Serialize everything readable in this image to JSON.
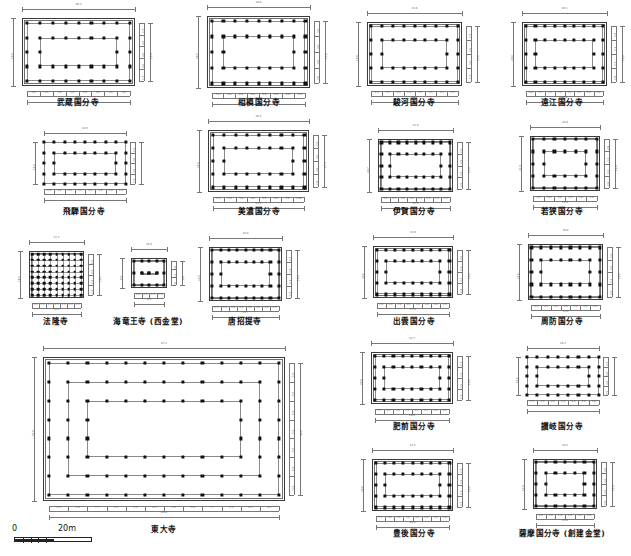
{
  "figure": {
    "type": "architectural-plan-comparison",
    "scale_bar": {
      "start_label": "0",
      "end_label": "20m",
      "length_m": 20,
      "segments": 5
    }
  },
  "plans": [
    {
      "id": "musashi-kokubunji",
      "caption": "武蔵国分寺",
      "has_outer_wall": true,
      "width_label": "40.3",
      "height_label": "19.4",
      "inner_width_label": "36.3",
      "inner_height_label": "15.4",
      "cols": 9,
      "rows": 5,
      "bay_labels_x": [
        "3.0",
        "5.0",
        "5.0",
        "5.0",
        "5.0",
        "5.0",
        "5.0",
        "3.6"
      ],
      "bay_labels_y": [
        "2.7",
        "4.0",
        "4.0",
        "4.0",
        "2.7"
      ]
    },
    {
      "id": "sagami-kokubunji",
      "caption": "相模国分寺",
      "has_outer_wall": true,
      "width_label": "38.0",
      "height_label": "20.5",
      "inner_width_label": "34.2",
      "inner_height_label": "17.0",
      "cols": 9,
      "rows": 5,
      "bay_labels_x": [
        "2.9",
        "4.8",
        "4.8",
        "4.8",
        "4.8",
        "4.8",
        "4.8",
        "2.9"
      ],
      "bay_labels_y": [
        "3.0",
        "4.0",
        "4.0",
        "3.0"
      ]
    },
    {
      "id": "suruga-kokubunji",
      "caption": "駿河国分寺",
      "has_outer_wall": true,
      "width_label": "32.6",
      "height_label": "19.0",
      "inner_width_label": "28.7",
      "inner_height_label": "17.0",
      "cols": 9,
      "rows": 5,
      "bay_labels_x": [
        "2.9",
        "3.5",
        "3.5",
        "3.5",
        "3.5",
        "3.5",
        "3.5",
        "2.9"
      ],
      "bay_labels_y": [
        "2.7",
        "3.6",
        "3.6",
        "2.7"
      ]
    },
    {
      "id": "totomi-kokubunji",
      "caption": "遠江国分寺",
      "has_outer_wall": true,
      "width_label": "30.1",
      "height_label": "20.0",
      "inner_width_label": "27.6",
      "inner_height_label": "16.0",
      "cols": 9,
      "rows": 5,
      "bay_labels_x": [
        "2.8",
        "3.2",
        "3.2",
        "3.2",
        "3.2",
        "3.2",
        "2.9",
        "2.8"
      ],
      "bay_labels_y": [
        "2.9",
        "3.3",
        "3.3",
        "2.9"
      ]
    },
    {
      "id": "hida-kokubunji",
      "caption": "飛騨国分寺",
      "has_outer_wall": false,
      "width_label": "28.5",
      "height_label": "14.0",
      "inner_width_label": "",
      "inner_height_label": "",
      "cols": 9,
      "rows": 5,
      "bay_labels_x": [
        "2.4",
        "3.0",
        "3.6",
        "3.6",
        "3.6",
        "3.6",
        "3.0",
        "2.4"
      ],
      "bay_labels_y": [
        "2.4",
        "3.0",
        "3.0",
        "2.4"
      ]
    },
    {
      "id": "mino-kokubunji",
      "caption": "美濃国分寺",
      "has_outer_wall": true,
      "width_label": "36.3",
      "height_label": "22.0",
      "inner_width_label": "29.5",
      "inner_height_label": "17.5",
      "cols": 9,
      "rows": 5,
      "bay_labels_x": [
        "2.9",
        "3.6",
        "3.6",
        "3.6",
        "3.6",
        "3.6",
        "3.0",
        "2.98"
      ],
      "bay_labels_y": [
        "2.9",
        "3.6",
        "3.6",
        "2.9"
      ]
    },
    {
      "id": "iga-kokubunji",
      "caption": "伊賀国分寺",
      "has_outer_wall": true,
      "width_label": "31.0",
      "height_label": "20.7",
      "inner_width_label": "26.6",
      "inner_height_label": "17.0",
      "cols": 9,
      "rows": 5,
      "bay_labels_x": [
        "2.6",
        "3.5",
        "3.0",
        "3.0",
        "3.0",
        "3.0",
        "3.0",
        "2.6"
      ],
      "bay_labels_y": [
        "2.6",
        "3.3",
        "3.3",
        "2.6"
      ]
    },
    {
      "id": "wakasa-kokubunji",
      "caption": "若狭国分寺",
      "has_outer_wall": true,
      "width_label": "28.0",
      "height_label": "21.0",
      "inner_width_label": "22.0",
      "inner_height_label": "16.0",
      "cols": 7,
      "rows": 5,
      "bay_labels_x": [
        "3.0",
        "3.0",
        "3.0",
        "3.0",
        "3.0",
        "3.0"
      ],
      "bay_labels_y": [
        "2.8",
        "3.3",
        "3.3",
        "2.8"
      ]
    },
    {
      "id": "horyuji",
      "caption": "法隆寺",
      "has_outer_wall": true,
      "width_label": "22.2",
      "height_label": "18.2",
      "inner_width_label": "20.2",
      "inner_height_label": "15.2",
      "cols": 9,
      "rows": 8,
      "dense_grid": true,
      "bay_labels_x": [
        "2.2",
        "2.3",
        "2.3",
        "2.3",
        "2.3",
        "2.3",
        "2.2"
      ],
      "bay_labels_y": [
        "2.2",
        "2.3",
        "2.3",
        "2.2"
      ]
    },
    {
      "id": "kairyuoji-saikondo",
      "caption": "海竜王寺 (西金堂)",
      "has_outer_wall": true,
      "width_label": "10.4",
      "height_label": "8.0",
      "inner_width_label": "8.4",
      "inner_height_label": "6.0",
      "cols": 5,
      "rows": 3,
      "bay_labels_x": [
        "2.0",
        "2.2",
        "2.2",
        "2.0"
      ],
      "bay_labels_y": [
        "2.0",
        "2.2",
        "2.0"
      ]
    },
    {
      "id": "toshodaiji",
      "caption": "唐招提寺",
      "has_outer_wall": true,
      "width_label": "28.0",
      "height_label": "20.0",
      "inner_width_label": "25.7",
      "inner_height_label": "16.0",
      "cols": 9,
      "rows": 5,
      "bay_labels_x": [
        "2.5",
        "3.0",
        "3.0",
        "3.0",
        "3.0",
        "3.0",
        "3.0",
        "2.5"
      ],
      "bay_labels_y": [
        "2.7",
        "3.3",
        "3.3",
        "2.7"
      ]
    },
    {
      "id": "izumo-kokubunji",
      "caption": "出雲国分寺",
      "has_outer_wall": true,
      "width_label": "32.0",
      "height_label": "20.0",
      "inner_width_label": "27.0",
      "inner_height_label": "16.0",
      "cols": 9,
      "rows": 5,
      "bay_labels_x": [
        "2.6",
        "3.0",
        "3.0",
        "3.0",
        "3.0",
        "3.0",
        "3.0",
        "2.6"
      ],
      "bay_labels_y": [
        "2.6",
        "3.2",
        "3.2",
        "2.6"
      ]
    },
    {
      "id": "suo-kokubunji",
      "caption": "周防国分寺",
      "has_outer_wall": true,
      "width_label": "30.0",
      "height_label": "22.0",
      "inner_width_label": "25.0",
      "inner_height_label": "16.0",
      "cols": 8,
      "rows": 5,
      "bay_labels_x": [
        "2.6",
        "3.0",
        "3.0",
        "3.0",
        "3.0",
        "3.0",
        "2.6"
      ],
      "bay_labels_y": [
        "2.6",
        "3.2",
        "3.2",
        "2.6"
      ]
    },
    {
      "id": "hizen-kokubunji",
      "caption": "肥前国分寺",
      "has_outer_wall": true,
      "width_label": "32.7",
      "height_label": "20.0",
      "inner_width_label": "28.4",
      "inner_height_label": "16.0",
      "cols": 9,
      "rows": 5,
      "bay_labels_x": [
        "2.7",
        "3.2",
        "3.2",
        "3.2",
        "3.2",
        "3.2",
        "3.0",
        "2.6"
      ],
      "bay_labels_y": [
        "2.7",
        "3.2",
        "3.2",
        "2.7"
      ]
    },
    {
      "id": "sanuki-kokubunji",
      "caption": "讃岐国分寺",
      "has_outer_wall": false,
      "width_label": "28.2",
      "height_label": "14.6",
      "inner_width_label": "",
      "inner_height_label": "",
      "cols": 8,
      "rows": 5,
      "bay_labels_x": [
        "2.5",
        "3.0",
        "4.0",
        "4.0",
        "4.0",
        "3.0",
        "2.6"
      ],
      "bay_labels_y": [
        "2.5",
        "3.0",
        "3.0",
        "2.5"
      ]
    },
    {
      "id": "bungo-kokubunji",
      "caption": "豊後国分寺",
      "has_outer_wall": true,
      "width_label": "32.5",
      "height_label": "20.0",
      "inner_width_label": "28.4",
      "inner_height_label": "16.0",
      "cols": 9,
      "rows": 5,
      "bay_labels_x": [
        "2.7",
        "3.0",
        "3.6",
        "3.6",
        "3.6",
        "3.6",
        "3.0",
        "2.6"
      ],
      "bay_labels_y": [
        "2.7",
        "3.3",
        "3.3",
        "2.7"
      ]
    },
    {
      "id": "satsuma-kokubunji",
      "caption": "薩摩国分寺 (創建金堂)",
      "has_outer_wall": true,
      "width_label": "20.1",
      "height_label": "16.0",
      "inner_width_label": "16.0",
      "inner_height_label": "12.0",
      "cols": 7,
      "rows": 5,
      "bay_labels_x": [
        "2.0",
        "2.0",
        "2.6",
        "2.6",
        "2.6",
        "2.6"
      ],
      "bay_labels_y": [
        "2.0",
        "2.6",
        "2.6",
        "2.0"
      ]
    },
    {
      "id": "todaiji",
      "caption": "東大寺",
      "has_outer_wall": true,
      "width_label": "87.1",
      "height_label": "52.0",
      "inner_width_label": "80.8",
      "inner_height_label": "46.0",
      "cols": 13,
      "rows": 8,
      "rings": 3,
      "bay_labels_x": [
        "5.5",
        "5.5",
        "7.7",
        "5.5",
        "5.5",
        "5.5",
        "5.5",
        "5.5",
        "7.7",
        "5.5",
        "5.5",
        "4.7"
      ],
      "bay_labels_y": [
        "5.5",
        "5.5",
        "5.5",
        "5.5",
        "5.5",
        "5.5",
        "5.5"
      ]
    }
  ]
}
